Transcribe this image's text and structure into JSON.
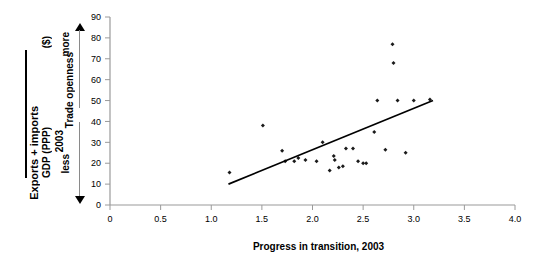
{
  "chart_data": {
    "type": "scatter",
    "title": "",
    "xlabel": "Progress in transition, 2003",
    "ylabel": "Trade openness",
    "xlim": [
      0,
      4.0
    ],
    "ylim": [
      0,
      90
    ],
    "xticks": [
      "0",
      "0.5",
      "1.0",
      "1.5",
      "2.0",
      "2.5",
      "3.0",
      "3.5",
      "4.0"
    ],
    "xtick_values": [
      0,
      0.5,
      1.0,
      1.5,
      2.0,
      2.5,
      3.0,
      3.5,
      4.0
    ],
    "yticks": [
      "0",
      "10",
      "20",
      "30",
      "40",
      "50",
      "60",
      "70",
      "80",
      "90"
    ],
    "ytick_values": [
      0,
      10,
      20,
      30,
      40,
      50,
      60,
      70,
      80,
      90
    ],
    "grid": false,
    "legend": null,
    "marker": "small-black-diamond",
    "points": [
      {
        "x": 1.18,
        "y": 15.5
      },
      {
        "x": 1.51,
        "y": 38.0
      },
      {
        "x": 1.7,
        "y": 26.0
      },
      {
        "x": 1.73,
        "y": 21.0
      },
      {
        "x": 1.82,
        "y": 21.0
      },
      {
        "x": 1.86,
        "y": 22.5
      },
      {
        "x": 1.93,
        "y": 21.5
      },
      {
        "x": 2.04,
        "y": 21.0
      },
      {
        "x": 2.1,
        "y": 30.0
      },
      {
        "x": 2.17,
        "y": 16.5
      },
      {
        "x": 2.21,
        "y": 23.5
      },
      {
        "x": 2.22,
        "y": 21.5
      },
      {
        "x": 2.26,
        "y": 18.0
      },
      {
        "x": 2.3,
        "y": 18.5
      },
      {
        "x": 2.33,
        "y": 27.0
      },
      {
        "x": 2.4,
        "y": 27.0
      },
      {
        "x": 2.45,
        "y": 21.0
      },
      {
        "x": 2.5,
        "y": 20.0
      },
      {
        "x": 2.53,
        "y": 20.0
      },
      {
        "x": 2.61,
        "y": 35.0
      },
      {
        "x": 2.64,
        "y": 50.0
      },
      {
        "x": 2.72,
        "y": 26.5
      },
      {
        "x": 2.79,
        "y": 77.0
      },
      {
        "x": 2.8,
        "y": 68.0
      },
      {
        "x": 2.84,
        "y": 50.0
      },
      {
        "x": 2.92,
        "y": 25.0
      },
      {
        "x": 3.0,
        "y": 50.0
      },
      {
        "x": 3.16,
        "y": 50.5
      }
    ],
    "trendline": {
      "type": "linear-fit",
      "x_start": 1.17,
      "y_start": 10.0,
      "x_end": 3.19,
      "y_end": 50.0
    }
  },
  "labels": {
    "y_axis_title": "Trade openness",
    "x_axis_title": "Progress in transition, 2003",
    "left_fraction_numerator": "Exports + imports",
    "left_fraction_denominator": "GDP (PPP)",
    "left_fraction_unit": "($)",
    "left_fraction_year": "2003",
    "direction_more": "more",
    "direction_less": "less"
  },
  "colors": {
    "marker": "#1a1a1a",
    "trendline": "#000000",
    "axis": "#808080",
    "text": "#000000",
    "background": "#ffffff"
  }
}
